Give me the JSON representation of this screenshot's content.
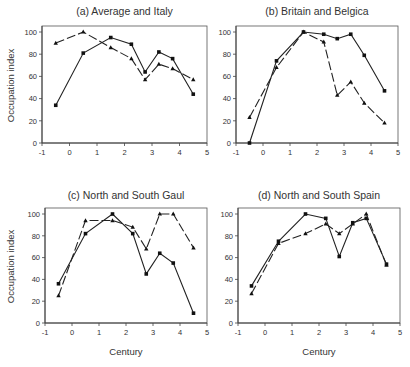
{
  "figure": {
    "ylabel": "Occupation index",
    "xlabel": "Century"
  },
  "chart_data": [
    {
      "type": "line",
      "title": "(a) Average and Italy",
      "xlabel": "",
      "ylabel": "Occupation index",
      "xlim": [
        -1,
        5
      ],
      "ylim": [
        0,
        100
      ],
      "xticks": [
        -1,
        0,
        1,
        2,
        3,
        4,
        5
      ],
      "yticks": [
        0,
        20,
        40,
        60,
        80,
        100
      ],
      "grid": false,
      "x": [
        -0.5,
        0.5,
        1.5,
        2.25,
        2.75,
        3.25,
        3.75,
        4.5
      ],
      "series": [
        {
          "name": "Italy",
          "style": "solid",
          "marker": "square",
          "values": [
            34,
            81,
            95,
            89,
            64,
            82,
            76,
            44
          ]
        },
        {
          "name": "Average",
          "style": "dashed",
          "marker": "triangle",
          "values": [
            90,
            100,
            86,
            76,
            57,
            71,
            67,
            57
          ]
        }
      ]
    },
    {
      "type": "line",
      "title": "(b) Britain and Belgica",
      "xlabel": "",
      "ylabel": "",
      "xlim": [
        -1,
        5
      ],
      "ylim": [
        0,
        100
      ],
      "xticks": [
        -1,
        0,
        1,
        2,
        3,
        4,
        5
      ],
      "yticks": [
        0,
        20,
        40,
        60,
        80,
        100
      ],
      "grid": false,
      "x": [
        -0.5,
        0.5,
        1.5,
        2.25,
        2.75,
        3.25,
        3.75,
        4.5
      ],
      "series": [
        {
          "name": "Belgica",
          "style": "solid",
          "marker": "square",
          "values": [
            0,
            74,
            100,
            98,
            94,
            98,
            79,
            47
          ]
        },
        {
          "name": "Britain",
          "style": "dashed",
          "marker": "triangle",
          "values": [
            23,
            68,
            100,
            91,
            43,
            55,
            36,
            18
          ]
        }
      ]
    },
    {
      "type": "line",
      "title": "(c) North and South Gaul",
      "xlabel": "Century",
      "ylabel": "Occupation index",
      "xlim": [
        -1,
        5
      ],
      "ylim": [
        0,
        100
      ],
      "xticks": [
        -1,
        0,
        1,
        2,
        3,
        4,
        5
      ],
      "yticks": [
        0,
        20,
        40,
        60,
        80,
        100
      ],
      "grid": false,
      "x": [
        -0.5,
        0.5,
        1.5,
        2.25,
        2.75,
        3.25,
        3.75,
        4.5
      ],
      "series": [
        {
          "name": "North Gaul",
          "style": "solid",
          "marker": "square",
          "values": [
            36,
            82,
            100,
            82,
            45,
            64,
            55,
            9
          ]
        },
        {
          "name": "South Gaul",
          "style": "dashed",
          "marker": "triangle",
          "values": [
            25,
            94,
            94,
            88,
            68,
            100,
            100,
            69
          ]
        }
      ]
    },
    {
      "type": "line",
      "title": "(d) North and South Spain",
      "xlabel": "Century",
      "ylabel": "",
      "xlim": [
        -1,
        5
      ],
      "ylim": [
        0,
        100
      ],
      "xticks": [
        -1,
        0,
        1,
        2,
        3,
        4,
        5
      ],
      "yticks": [
        0,
        20,
        40,
        60,
        80,
        100
      ],
      "grid": false,
      "x": [
        -0.5,
        0.5,
        1.5,
        2.25,
        2.75,
        3.25,
        3.75,
        4.5
      ],
      "series": [
        {
          "name": "North Spain",
          "style": "solid",
          "marker": "square",
          "values": [
            34,
            75,
            100,
            96,
            61,
            92,
            96,
            54
          ]
        },
        {
          "name": "South Spain",
          "style": "dashed",
          "marker": "triangle",
          "values": [
            27,
            73,
            82,
            91,
            82,
            91,
            100,
            53
          ]
        }
      ]
    }
  ],
  "layout": {
    "panels": [
      {
        "x0": 42,
        "x1": 207,
        "yTop": 32,
        "yBottom": 143,
        "frameTop": 26,
        "titleY": 15
      },
      {
        "x0": 236,
        "x1": 398,
        "yTop": 32,
        "yBottom": 143,
        "frameTop": 26,
        "titleY": 15
      },
      {
        "x0": 45,
        "x1": 207,
        "yTop": 214,
        "yBottom": 323,
        "frameTop": 208,
        "titleY": 199
      },
      {
        "x0": 238,
        "x1": 400,
        "yTop": 214,
        "yBottom": 323,
        "frameTop": 208,
        "titleY": 199
      }
    ]
  }
}
